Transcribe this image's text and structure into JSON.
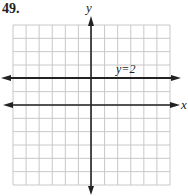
{
  "problem": {
    "number": "49."
  },
  "chart_data": {
    "type": "line",
    "title": "",
    "xlabel": "x",
    "ylabel": "y",
    "xlim": [
      -6,
      6
    ],
    "ylim": [
      -6,
      6
    ],
    "grid": true,
    "grid_step": 1,
    "series": [
      {
        "name": "y=2",
        "equation": "y = 2",
        "x": [
          -6,
          6
        ],
        "y": [
          2,
          2
        ]
      }
    ],
    "annotations": [
      {
        "text": "y=2",
        "x": 2.5,
        "y": 2.5
      }
    ]
  },
  "labels": {
    "x_axis": "x",
    "y_axis": "y",
    "line": "y=2"
  },
  "colors": {
    "grid": "#c8c8c8",
    "axes": "#222222",
    "line": "#222222"
  }
}
